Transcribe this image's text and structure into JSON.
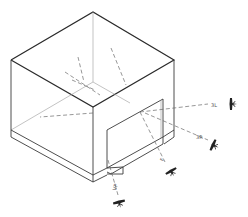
{
  "diagram": {
    "title": "",
    "type": "isometric-box-with-opening",
    "colors": {
      "edge": "#3a3a3a",
      "ray": "#6a6a6a",
      "background": "#ffffff"
    },
    "rays": [
      {
        "id": "ray-right-upper",
        "label": "3L"
      },
      {
        "id": "ray-right-lower",
        "label": "3R"
      },
      {
        "id": "ray-bottom-right",
        "label": "F"
      },
      {
        "id": "ray-bottom-left",
        "label": "VP"
      }
    ],
    "viewers": [
      {
        "id": "viewer-right-upper",
        "icon": "eye-viewer-icon"
      },
      {
        "id": "viewer-right-lower",
        "icon": "eye-viewer-icon"
      },
      {
        "id": "viewer-bottom-right",
        "icon": "eye-viewer-icon"
      },
      {
        "id": "viewer-bottom-left",
        "icon": "eye-viewer-icon"
      }
    ]
  }
}
